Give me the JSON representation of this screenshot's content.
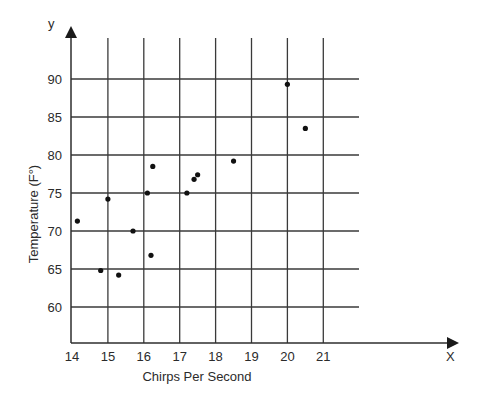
{
  "chart_data": {
    "type": "scatter",
    "title": "",
    "xlabel": "Chirps Per Second",
    "ylabel": "Temperature (F°)",
    "x_axis_letter": "X",
    "y_axis_letter": "y",
    "xlim": [
      14,
      22
    ],
    "ylim": [
      55.5,
      90
    ],
    "x_ticks": [
      14,
      15,
      16,
      17,
      18,
      19,
      20,
      21
    ],
    "y_ticks": [
      60,
      65,
      70,
      75,
      80,
      85,
      90
    ],
    "grid": true,
    "legend": null,
    "points": [
      {
        "x": 14.15,
        "y": 71.3
      },
      {
        "x": 14.8,
        "y": 64.8
      },
      {
        "x": 15.0,
        "y": 74.2
      },
      {
        "x": 15.3,
        "y": 64.2
      },
      {
        "x": 15.7,
        "y": 70.0
      },
      {
        "x": 16.1,
        "y": 75.0
      },
      {
        "x": 16.2,
        "y": 66.8
      },
      {
        "x": 16.25,
        "y": 78.5
      },
      {
        "x": 17.2,
        "y": 75.0
      },
      {
        "x": 17.4,
        "y": 76.8
      },
      {
        "x": 17.5,
        "y": 77.4
      },
      {
        "x": 18.5,
        "y": 79.2
      },
      {
        "x": 20.0,
        "y": 89.3
      },
      {
        "x": 20.5,
        "y": 83.5
      }
    ]
  }
}
